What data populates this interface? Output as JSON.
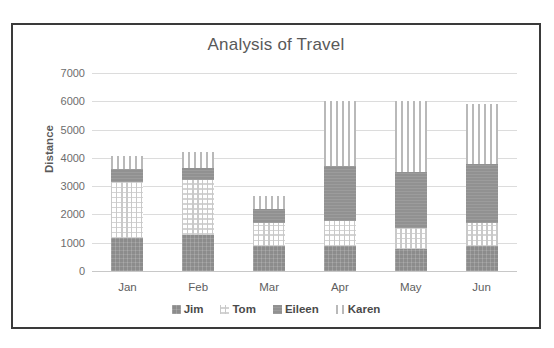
{
  "chart_data": {
    "type": "bar",
    "subtype": "stacked-bar",
    "title": "Analysis of Travel",
    "xlabel": "",
    "ylabel": "Distance",
    "categories": [
      "Jan",
      "Feb",
      "Mar",
      "Apr",
      "May",
      "Jun"
    ],
    "ylim": [
      0,
      7000
    ],
    "yticks": [
      0,
      1000,
      2000,
      3000,
      4000,
      5000,
      6000,
      7000
    ],
    "ytick_labels": [
      "0",
      "1000",
      "2000",
      "3000",
      "4000",
      "5000",
      "6000",
      "7000"
    ],
    "grid": true,
    "legend_position": "bottom",
    "series": [
      {
        "name": "Jim",
        "color": "#8c8c8c",
        "pattern": "solid-grey",
        "values": [
          1150,
          1280,
          880,
          880,
          790,
          880
        ]
      },
      {
        "name": "Tom",
        "color": "#ffffff",
        "pattern": "grid-crosshatch",
        "values": [
          2000,
          1950,
          820,
          880,
          740,
          800
        ]
      },
      {
        "name": "Eileen",
        "color": "#919191",
        "pattern": "solid-grey",
        "values": [
          450,
          400,
          500,
          1950,
          1980,
          2120
        ]
      },
      {
        "name": "Karen",
        "color": "#ffffff",
        "pattern": "vertical-stripes",
        "values": [
          480,
          590,
          450,
          2290,
          2490,
          2100
        ]
      }
    ],
    "totals": [
      4080,
      4220,
      2650,
      6000,
      6000,
      5900
    ]
  },
  "legend": {
    "items": [
      {
        "label": "Jim"
      },
      {
        "label": "Tom"
      },
      {
        "label": "Eileen"
      },
      {
        "label": "Karen"
      }
    ]
  }
}
